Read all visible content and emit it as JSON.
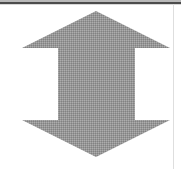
{
  "canvas": {
    "width": 181,
    "height": 169,
    "background_color": "#ffffff"
  },
  "borders": {
    "top_rule_color": "#4c4c4c",
    "top_wash_color": "#b9b9b9",
    "top_rule_echo_color": "#d8d8d8",
    "right_rule_color": "#dedede"
  },
  "figure": {
    "name": "double-headed-vertical-arrow",
    "fill_color": "#979797",
    "fill_texture": "halftone-dither",
    "dither_light_color": "#adadad",
    "dither_dark_color": "#828282",
    "points": "96,11 170,48 135,48 135,120 170,120 96,157 22,120 58,120 58,48 22,48",
    "geometry": {
      "top_apex_x": 96,
      "top_apex_y": 11,
      "upper_shoulder_y": 48,
      "left_tip_x": 22,
      "right_tip_x": 170,
      "shaft_left_x": 58,
      "shaft_right_x": 135,
      "lower_shoulder_y": 120,
      "bottom_apex_x": 96,
      "bottom_apex_y": 157
    }
  }
}
